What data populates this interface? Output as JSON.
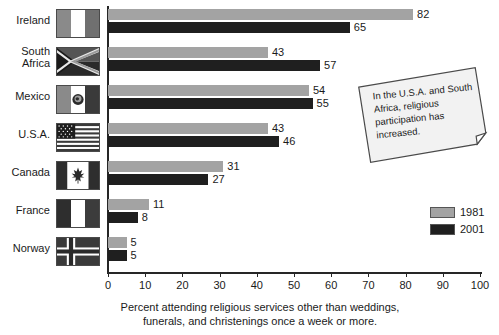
{
  "chart_data": {
    "type": "bar",
    "orientation": "horizontal",
    "title": "",
    "xlabel": "Percent attending religious services other than weddings, funerals, and christenings once a week or more.",
    "ylabel": "",
    "xlim": [
      0,
      100
    ],
    "xticks": [
      0,
      10,
      20,
      30,
      40,
      50,
      60,
      70,
      80,
      90,
      100
    ],
    "grid": false,
    "legend_position": "right",
    "categories": [
      "Ireland",
      "South Africa",
      "Mexico",
      "U.S.A.",
      "Canada",
      "France",
      "Norway"
    ],
    "series": [
      {
        "name": "1981",
        "color": "#a3a3a3",
        "values": [
          82,
          43,
          54,
          43,
          31,
          11,
          5
        ]
      },
      {
        "name": "2001",
        "color": "#1f1f1f",
        "values": [
          65,
          57,
          55,
          46,
          27,
          8,
          5
        ]
      }
    ],
    "annotations": [
      "In the U.S.A. and South Africa, religious participation has increased."
    ]
  },
  "axis": {
    "tick_labels": [
      "0",
      "10",
      "20",
      "30",
      "40",
      "50",
      "60",
      "70",
      "80",
      "90",
      "100"
    ],
    "caption_line1": "Percent attending religious services other than weddings,",
    "caption_line2": "funerals, and christenings once a week or more."
  },
  "rows": [
    {
      "label_line1": "Ireland",
      "label_line2": "",
      "flag": "flag-ireland",
      "v1981": "82",
      "v2001": "65"
    },
    {
      "label_line1": "South",
      "label_line2": "Africa",
      "flag": "flag-south-africa",
      "v1981": "43",
      "v2001": "57"
    },
    {
      "label_line1": "Mexico",
      "label_line2": "",
      "flag": "flag-mexico",
      "v1981": "54",
      "v2001": "55"
    },
    {
      "label_line1": "U.S.A.",
      "label_line2": "",
      "flag": "flag-usa",
      "v1981": "43",
      "v2001": "46"
    },
    {
      "label_line1": "Canada",
      "label_line2": "",
      "flag": "flag-canada",
      "v1981": "31",
      "v2001": "27"
    },
    {
      "label_line1": "France",
      "label_line2": "",
      "flag": "flag-france",
      "v1981": "11",
      "v2001": "8"
    },
    {
      "label_line1": "Norway",
      "label_line2": "",
      "flag": "flag-norway",
      "v1981": "5",
      "v2001": "5"
    }
  ],
  "legend": {
    "items": [
      {
        "label": "1981",
        "color": "#a3a3a3"
      },
      {
        "label": "2001",
        "color": "#1f1f1f"
      }
    ]
  },
  "callout": {
    "text": "In the U.S.A. and South Africa, religious participation has increased."
  }
}
